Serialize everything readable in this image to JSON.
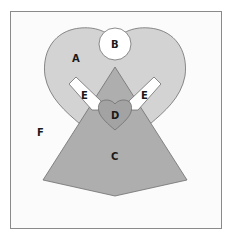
{
  "diagram": {
    "colors": {
      "background": "#ffffff",
      "frame_fill": "#fbfbfb",
      "frame_stroke": "#8a8a8a",
      "shape_stroke": "#6e6e6e",
      "heart_a": "#d3d3d3",
      "circle_b": "#ffffff",
      "triangle_c": "#aeaeae",
      "heart_d": "#a3a3a3",
      "bars_e": "#ffffff"
    },
    "labels": {
      "a": "A",
      "b": "B",
      "c": "C",
      "d": "D",
      "e_left": "E",
      "e_right": "E",
      "f": "F"
    }
  }
}
